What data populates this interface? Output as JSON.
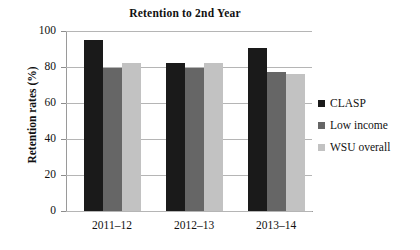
{
  "chart_data": {
    "type": "bar",
    "title": "Retention to 2nd Year",
    "xlabel": "",
    "ylabel": "Retention rates (%)",
    "categories": [
      "2011–12",
      "2012–13",
      "2013–14"
    ],
    "series": [
      {
        "name": "CLASP",
        "color": "#1a1a1a",
        "values": [
          95,
          82,
          90.5
        ]
      },
      {
        "name": "Low income",
        "color": "#666666",
        "values": [
          79.5,
          79.5,
          77
        ]
      },
      {
        "name": "WSU overall",
        "color": "#c2c2c2",
        "values": [
          82,
          82,
          76
        ]
      }
    ],
    "ylim": [
      0,
      100
    ],
    "yticks": [
      0,
      20,
      40,
      60,
      80,
      100
    ],
    "ytick_labels": [
      "0",
      "20",
      "40",
      "60",
      "80",
      "100"
    ],
    "grid": true,
    "legend_position": "right"
  }
}
